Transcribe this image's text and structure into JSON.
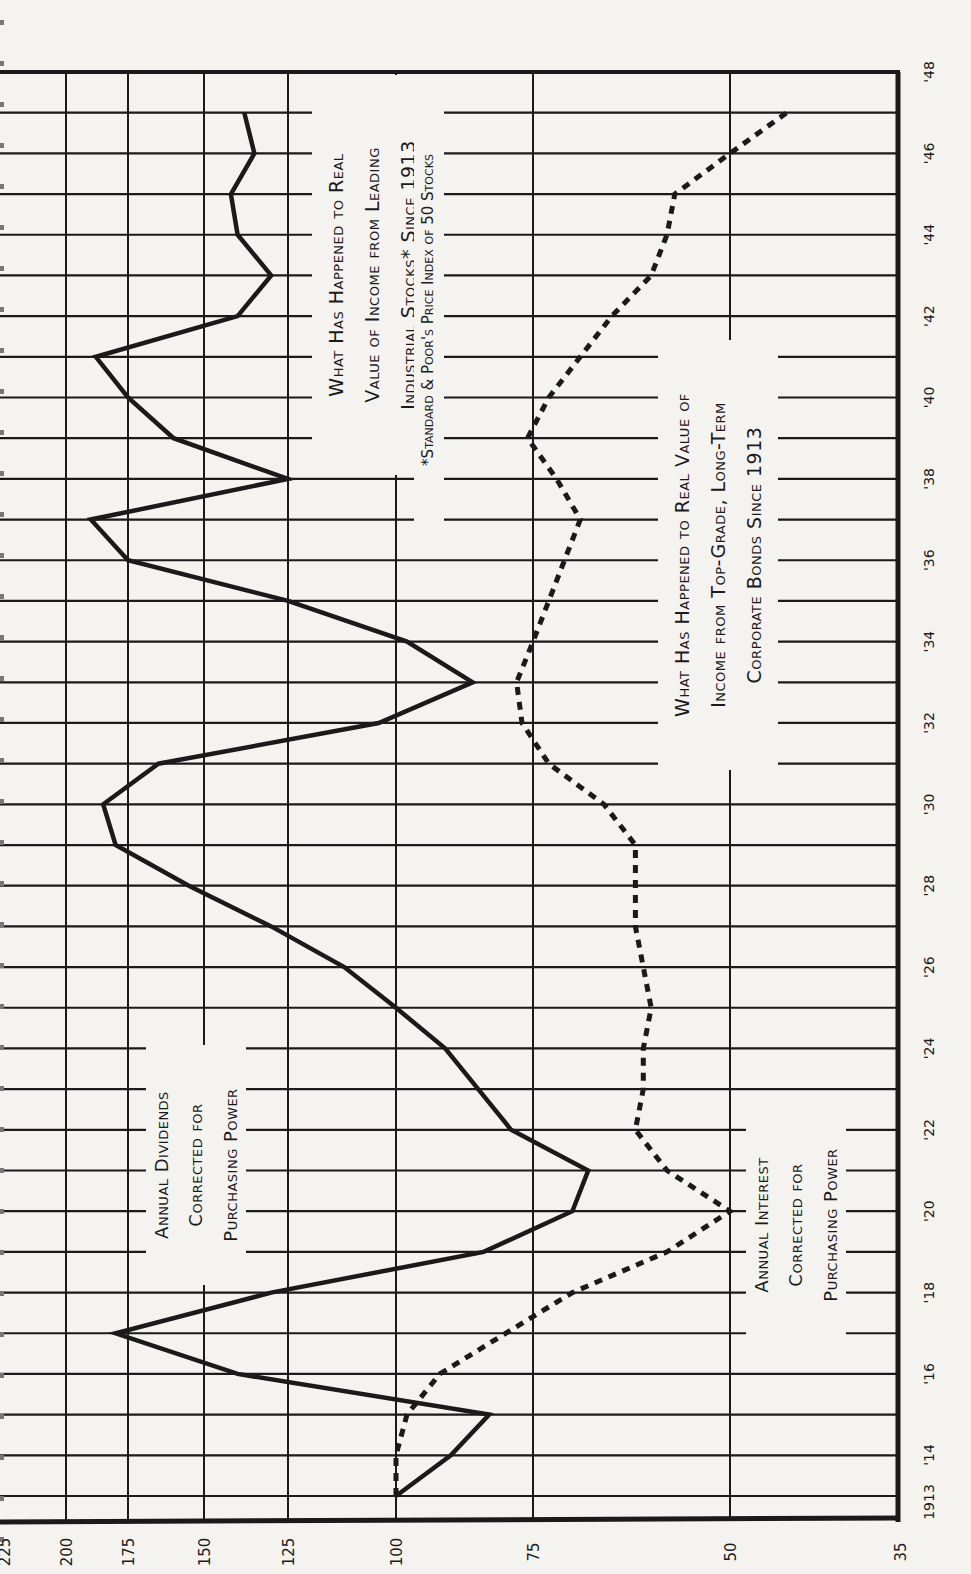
{
  "chart_data": {
    "type": "line",
    "orientation": "rotated-90-ccw",
    "xlabel": "Year",
    "ylabel": "Index (1913 = 100)",
    "x": [
      1913,
      1914,
      1915,
      1916,
      1917,
      1918,
      1919,
      1920,
      1921,
      1922,
      1923,
      1924,
      1925,
      1926,
      1927,
      1928,
      1929,
      1930,
      1931,
      1932,
      1933,
      1934,
      1935,
      1936,
      1937,
      1938,
      1939,
      1940,
      1941,
      1942,
      1943,
      1944,
      1945,
      1946,
      1947
    ],
    "x_tick_labels": [
      "1913",
      "'14",
      "'16",
      "'18",
      "'20",
      "'22",
      "'24",
      "'26",
      "'28",
      "'30",
      "'32",
      "'34",
      "'36",
      "'38",
      "'40",
      "'42",
      "'44",
      "'46",
      "'48"
    ],
    "y_ticks": [
      225,
      200,
      175,
      150,
      125,
      100,
      75,
      50,
      35
    ],
    "ylim": [
      35,
      225
    ],
    "grid": true,
    "series": [
      {
        "name": "Annual Dividends Corrected for Purchasing Power",
        "style": "solid",
        "values": [
          100,
          90,
          83,
          140,
          180,
          130,
          84,
          70,
          68,
          79,
          85,
          91,
          100,
          112,
          130,
          155,
          180,
          185,
          165,
          104,
          86,
          98,
          125,
          175,
          190,
          125,
          160,
          175,
          188,
          140,
          130,
          140,
          142,
          135,
          138
        ]
      },
      {
        "name": "Annual Interest Corrected for Purchasing Power",
        "style": "dotted",
        "values": [
          100,
          100,
          98,
          92,
          80,
          70,
          58,
          50,
          58,
          62,
          61,
          61,
          60,
          61,
          62,
          62,
          62,
          66,
          73,
          77,
          78,
          75,
          73,
          71,
          69,
          72,
          76,
          73,
          69,
          65,
          60,
          58,
          57,
          50,
          45
        ]
      }
    ],
    "annotations": {
      "stocks_title": [
        "What Has Happened to Real",
        "Value of Income from Leading",
        "Industrial Stocks* Since 1913"
      ],
      "stocks_footnote": "*Standard & Poor's Price Index of 50 Stocks",
      "bonds_title": [
        "What Has Happened to Real Value of",
        "Income from Top-Grade, Long-Term",
        "Corporate Bonds Since 1913"
      ],
      "dividends_label": [
        "Annual Dividends",
        "Corrected for",
        "Purchasing Power"
      ],
      "interest_label": [
        "Annual Interest",
        "Corrected for",
        "Purchasing Power"
      ]
    }
  },
  "colors": {
    "ink": "#1a1a1a",
    "paper": "#f4f3f0"
  }
}
